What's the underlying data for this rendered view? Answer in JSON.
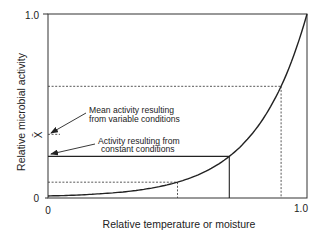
{
  "chart_data": {
    "type": "line",
    "title": "",
    "xlabel": "Relative temperature or moisture",
    "ylabel": "Relative microbial activity",
    "xlim": [
      0,
      1.0
    ],
    "ylim": [
      0,
      1.0
    ],
    "grid": false,
    "legend": null,
    "x_ticks": [
      "0",
      "1.0"
    ],
    "y_ticks": [
      "0",
      "1.0"
    ],
    "series": [
      {
        "name": "Activity response curve",
        "x": [
          0,
          0.1,
          0.2,
          0.3,
          0.4,
          0.5,
          0.6,
          0.7,
          0.8,
          0.85,
          0.9,
          0.95,
          1.0
        ],
        "y": [
          0.011,
          0.015,
          0.023,
          0.034,
          0.054,
          0.086,
          0.139,
          0.226,
          0.37,
          0.474,
          0.607,
          0.779,
          1.0
        ]
      }
    ],
    "reference_lines": [
      {
        "name": "low condition",
        "x": 0.5,
        "y": 0.086,
        "style": "dotted"
      },
      {
        "name": "high condition",
        "x": 0.9,
        "y": 0.607,
        "style": "dotted"
      },
      {
        "name": "constant condition",
        "x": 0.7,
        "y": 0.226,
        "style": "solid"
      },
      {
        "name": "mean of variable conditions",
        "y": 0.346,
        "style": "dotted-short"
      }
    ],
    "annotations": [
      {
        "text": [
          "Mean activity resulting",
          "from variable conditions"
        ],
        "points_to": "mean of variable conditions"
      },
      {
        "text": [
          "Activity resulting from",
          "constant conditions"
        ],
        "points_to": "constant condition"
      }
    ],
    "mean_symbol": "X̄"
  },
  "labels": {
    "y_top": "1.0",
    "y_zero": "0",
    "x_zero": "0",
    "x_right": "1.0",
    "xlabel": "Relative temperature or moisture",
    "ylabel": "Relative microbial activity",
    "mean_symbol": "X̄",
    "mean_line1": "Mean activity resulting",
    "mean_line2": "from variable conditions",
    "const_line1": "Activity resulting from",
    "const_line2": "constant conditions"
  },
  "colors": {
    "line": "#222222",
    "dotted": "#444444",
    "background": "#ffffff"
  }
}
